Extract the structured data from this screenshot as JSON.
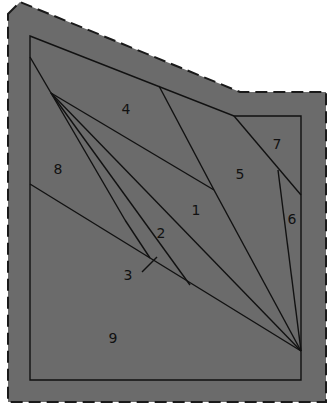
{
  "diagram": {
    "type": "piecing-pattern",
    "colors": {
      "fill": "#6b6b6b",
      "line": "#111111",
      "dash": "#1a1a1a",
      "background": "#ffffff"
    },
    "outer_polygon": [
      [
        8,
        14
      ],
      [
        20,
        2
      ],
      [
        240,
        92
      ],
      [
        326,
        92
      ],
      [
        326,
        402
      ],
      [
        8,
        402
      ]
    ],
    "inner_polygon": [
      [
        30,
        36
      ],
      [
        234,
        116
      ],
      [
        301,
        116
      ],
      [
        301,
        380
      ],
      [
        30,
        380
      ]
    ],
    "lines": [
      [
        [
          30,
          57
        ],
        [
          51,
          93
        ]
      ],
      [
        [
          51,
          93
        ],
        [
          214,
          190
        ]
      ],
      [
        [
          51,
          93
        ],
        [
          301,
          351
        ]
      ],
      [
        [
          51,
          93
        ],
        [
          125,
          220
        ]
      ],
      [
        [
          125,
          220
        ],
        [
          150,
          258
        ]
      ],
      [
        [
          51,
          93
        ],
        [
          190,
          285
        ]
      ],
      [
        [
          30,
          184
        ],
        [
          301,
          351
        ]
      ],
      [
        [
          159,
          86
        ],
        [
          214,
          190
        ]
      ],
      [
        [
          214,
          190
        ],
        [
          301,
          351
        ]
      ],
      [
        [
          234,
          116
        ],
        [
          301,
          195
        ]
      ],
      [
        [
          278,
          170
        ],
        [
          301,
          351
        ]
      ],
      [
        [
          142,
          272
        ],
        [
          157,
          257
        ]
      ]
    ],
    "labels": [
      {
        "text": "1",
        "x": 196,
        "y": 215
      },
      {
        "text": "2",
        "x": 161,
        "y": 238
      },
      {
        "text": "3",
        "x": 128,
        "y": 280
      },
      {
        "text": "4",
        "x": 126,
        "y": 114
      },
      {
        "text": "5",
        "x": 240,
        "y": 179
      },
      {
        "text": "6",
        "x": 292,
        "y": 224
      },
      {
        "text": "7",
        "x": 277,
        "y": 149
      },
      {
        "text": "8",
        "x": 58,
        "y": 174
      },
      {
        "text": "9",
        "x": 113,
        "y": 343
      }
    ]
  }
}
